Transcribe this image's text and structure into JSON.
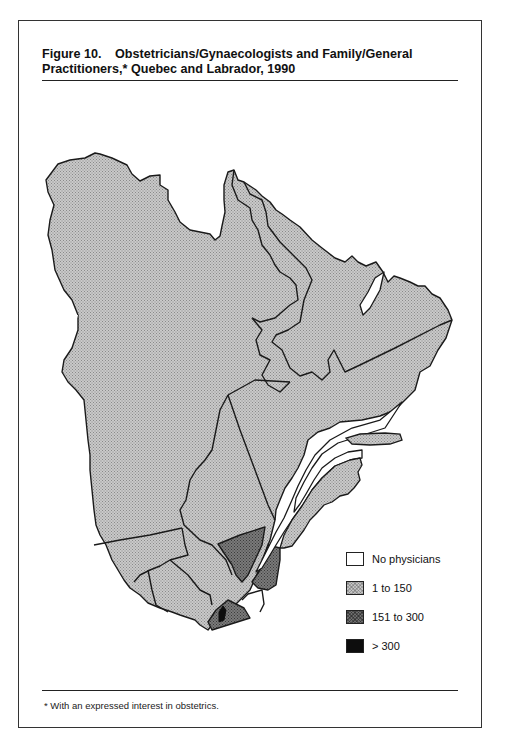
{
  "figure": {
    "number": "Figure 10.",
    "title_line1": "Obstetricians/Gynaecologists and Family/General",
    "title_line2": "Practitioners,* Quebec and Labrador, 1990",
    "footnote": "* With an expressed interest in obstetrics."
  },
  "legend": {
    "items": [
      {
        "label": "No physicians",
        "category": "none",
        "color": "#ffffff"
      },
      {
        "label": "1 to 150",
        "category": "low",
        "color": "#bdbdbd"
      },
      {
        "label": "151 to 300",
        "category": "mid",
        "color": "#6e6e6e"
      },
      {
        "label": "> 300",
        "category": "high",
        "color": "#0d0d0d"
      }
    ]
  },
  "map": {
    "region": "Quebec and Labrador",
    "year": "1990",
    "regions": [
      {
        "name": "Northern Quebec (Nouveau-Québec)",
        "category": "low"
      },
      {
        "name": "Labrador West",
        "category": "low"
      },
      {
        "name": "Labrador East",
        "category": "low"
      },
      {
        "name": "Côte-Nord",
        "category": "low"
      },
      {
        "name": "Anticosti Island",
        "category": "low"
      },
      {
        "name": "Gaspésie / Bas-Saint-Laurent",
        "category": "low"
      },
      {
        "name": "Saguenay–Lac-Saint-Jean",
        "category": "low"
      },
      {
        "name": "Mauricie",
        "category": "low"
      },
      {
        "name": "Abitibi-Témiscamingue",
        "category": "low"
      },
      {
        "name": "Outaouais",
        "category": "low"
      },
      {
        "name": "Laurentides",
        "category": "low"
      },
      {
        "name": "Lanaudière",
        "category": "low"
      },
      {
        "name": "Quebec City region",
        "category": "mid"
      },
      {
        "name": "Chaudière-Appalaches",
        "category": "mid"
      },
      {
        "name": "Centre-du-Québec",
        "category": "low"
      },
      {
        "name": "Estrie",
        "category": "low"
      },
      {
        "name": "Montérégie",
        "category": "mid"
      },
      {
        "name": "Montreal",
        "category": "high"
      }
    ]
  }
}
